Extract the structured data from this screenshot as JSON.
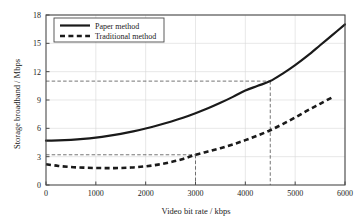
{
  "chart_data": {
    "type": "line",
    "title": "",
    "xlabel": "Video bit rate / kbps",
    "ylabel": "Storage broadband / Mbps",
    "xlim": [
      0,
      6000
    ],
    "ylim": [
      0,
      18
    ],
    "xticks": [
      "0",
      "1000",
      "2000",
      "3000",
      "4000",
      "5000",
      "6000"
    ],
    "xtick_values": [
      0,
      1000,
      2000,
      3000,
      4000,
      5000,
      6000
    ],
    "yticks": [
      "0",
      "3",
      "6",
      "9",
      "12",
      "15",
      "18"
    ],
    "ytick_values": [
      0,
      3,
      6,
      9,
      12,
      15,
      18
    ],
    "grid": true,
    "legend_position": "upper left",
    "series": [
      {
        "name": "Paper method",
        "style": "solid",
        "color": "#1a1a1a",
        "x": [
          0,
          250,
          500,
          750,
          1000,
          1250,
          1500,
          1750,
          2000,
          2250,
          2500,
          2750,
          3000,
          3250,
          3500,
          3750,
          4000,
          4250,
          4500,
          4750,
          5000,
          5250,
          5500,
          5750,
          6000
        ],
        "values": [
          4.7,
          4.72,
          4.78,
          4.88,
          5.02,
          5.2,
          5.42,
          5.68,
          5.98,
          6.32,
          6.7,
          7.12,
          7.6,
          8.12,
          8.7,
          9.33,
          10.0,
          10.5,
          11.0,
          11.8,
          12.7,
          13.7,
          14.8,
          15.9,
          17.0
        ]
      },
      {
        "name": "Traditional method",
        "style": "dashed",
        "color": "#1a1a1a",
        "x": [
          0,
          250,
          500,
          750,
          1000,
          1250,
          1500,
          1750,
          2000,
          2250,
          2500,
          2750,
          3000,
          3250,
          3500,
          3750,
          4000,
          4250,
          4500,
          4750,
          5000,
          5250,
          5500,
          5750
        ],
        "values": [
          2.2,
          2.02,
          1.9,
          1.84,
          1.8,
          1.79,
          1.8,
          1.86,
          1.98,
          2.16,
          2.42,
          2.76,
          3.2,
          3.55,
          3.9,
          4.3,
          4.75,
          5.25,
          5.8,
          6.45,
          7.15,
          7.9,
          8.6,
          9.3
        ]
      }
    ],
    "annotations": [
      {
        "name": "paper-method-marker",
        "x": 4500,
        "y": 11.0,
        "style": "dashed-guide",
        "series": "Paper method"
      },
      {
        "name": "traditional-method-marker",
        "x": 3000,
        "y": 3.2,
        "style": "dashed-guide",
        "series": "Traditional method"
      }
    ]
  },
  "colors": {
    "line": "#1a1a1a",
    "grid": "#d8d8d8",
    "axis": "#4a4a4a",
    "guide": "#3a3a3a",
    "background": "#ffffff"
  }
}
